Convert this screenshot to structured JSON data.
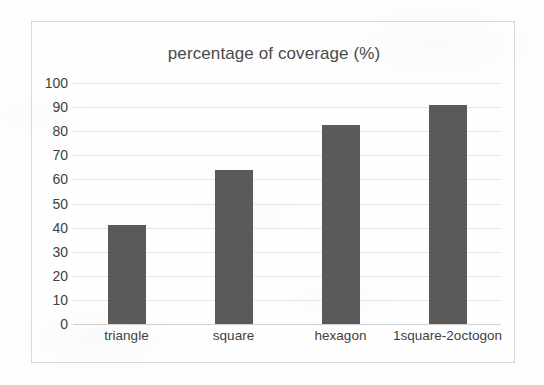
{
  "chart_data": {
    "type": "bar",
    "title": "percentage of coverage (%)",
    "xlabel": "",
    "ylabel": "",
    "categories": [
      "triangle",
      "square",
      "hexagon",
      "1square-2octogon"
    ],
    "values": [
      41,
      64,
      82.5,
      91
    ],
    "ylim": [
      0,
      100
    ],
    "ytick_labels": [
      "100",
      "90",
      "80",
      "70",
      "60",
      "50",
      "40",
      "30",
      "20",
      "10",
      "0"
    ],
    "ytick_values": [
      100,
      90,
      80,
      70,
      60,
      50,
      40,
      30,
      20,
      10,
      0
    ],
    "grid": true,
    "legend": false,
    "legend_position": "none",
    "series": [
      {
        "name": "percentage of coverage",
        "values": [
          41,
          64,
          82.5,
          91
        ],
        "color": "#5a5a5a"
      }
    ],
    "colors": {
      "bar": "#5a5a5a",
      "gridline": "#e6e6e6",
      "axis": "#d2d2d2",
      "text": "#3f3f3f",
      "title": "#4a4a4a",
      "frame": "#d8d8d8",
      "background": "#fefefe"
    }
  }
}
